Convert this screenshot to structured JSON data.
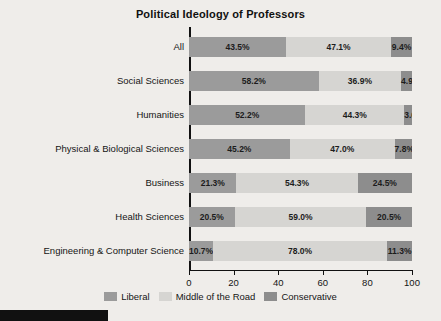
{
  "chart_data": {
    "type": "bar",
    "orientation": "horizontal",
    "stacked": true,
    "title": "Political Ideology of Professors",
    "xlabel": "",
    "ylabel": "",
    "xlim": [
      0,
      100
    ],
    "xticks": [
      0,
      20,
      40,
      60,
      80,
      100
    ],
    "xticklabels": [
      "0",
      "20",
      "40",
      "60",
      "80",
      "100"
    ],
    "grid": false,
    "legend_position": "bottom-center",
    "categories": [
      "All",
      "Social Sciences",
      "Humanities",
      "Physical & Biological Sciences",
      "Business",
      "Health Sciences",
      "Engineering & Computer Science"
    ],
    "series": [
      {
        "name": "Liberal",
        "color": "#9b9b9b",
        "values": [
          43.5,
          58.2,
          52.2,
          45.2,
          21.3,
          20.5,
          10.7
        ],
        "labels": [
          "43.5%",
          "58.2%",
          "52.2%",
          "45.2%",
          "21.3%",
          "20.5%",
          "10.7%"
        ]
      },
      {
        "name": "Middle of the Road",
        "color": "#d6d5d2",
        "values": [
          47.1,
          36.9,
          44.3,
          47.0,
          54.3,
          59.0,
          78.0
        ],
        "labels": [
          "47.1%",
          "36.9%",
          "44.3%",
          "47.0%",
          "54.3%",
          "59.0%",
          "78.0%"
        ]
      },
      {
        "name": "Conservative",
        "color": "#8d8d8d",
        "values": [
          9.4,
          4.9,
          3.6,
          7.8,
          24.5,
          20.5,
          11.3
        ],
        "labels": [
          "9.4%",
          "4.9%",
          "3.6%",
          "7.8%",
          "24.5%",
          "20.5%",
          "11.3%"
        ]
      }
    ]
  },
  "legend": {
    "items": [
      {
        "label": "Liberal",
        "color": "#9b9b9b"
      },
      {
        "label": "Middle of the Road",
        "color": "#d6d5d2"
      },
      {
        "label": "Conservative",
        "color": "#8d8d8d"
      }
    ]
  },
  "colors": {
    "liberal": "#9b9b9b",
    "middle": "#d6d5d2",
    "conservative": "#8d8d8d",
    "background": "#efedea",
    "axis": "#111111",
    "text": "#151515"
  }
}
